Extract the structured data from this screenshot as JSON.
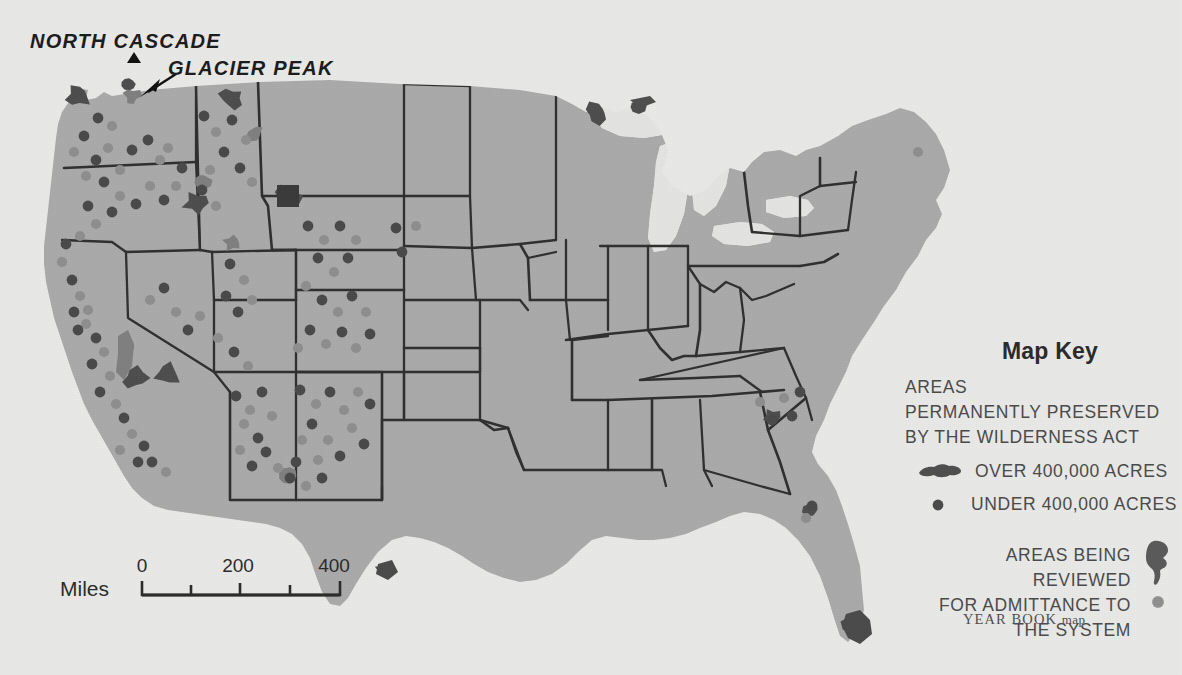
{
  "map": {
    "title_callouts": [
      {
        "id": "north-cascade",
        "text": "NORTH CASCADE"
      },
      {
        "id": "glacier-peak",
        "text": "GLACIER PEAK"
      }
    ],
    "colors": {
      "paper": "#e8e8e6",
      "land": "#a9a9a9",
      "water": "#e3e3e1",
      "wilderness_large": "#4e4e4e",
      "wilderness_small_dot": "#4a4a4a",
      "review_area": "#7f7f7f",
      "review_dot": "#8e8e8e",
      "border": "#2f2f2f",
      "text": "#3a3a3a"
    }
  },
  "scale": {
    "unit_label": "Miles",
    "tick_labels": [
      "0",
      "200",
      "400"
    ]
  },
  "key": {
    "title": "Map Key",
    "heading_lines": [
      "AREAS",
      "PERMANENTLY PRESERVED",
      "BY THE WILDERNESS ACT"
    ],
    "entries": [
      {
        "symbol": "wilderness-blob",
        "label": "OVER 400,000 ACRES"
      },
      {
        "symbol": "wilderness-dot",
        "label": "UNDER 400,000 ACRES"
      }
    ],
    "review_lines": [
      "AREAS BEING REVIEWED",
      "FOR ADMITTANCE TO",
      "THE SYSTEM"
    ]
  },
  "credit": {
    "bold_part": "YEAR BOOK",
    "light_part": "map"
  },
  "chart_data": {
    "type": "map",
    "title": "Areas Permanently Preserved by the Wilderness Act",
    "projection": "conterminous United States",
    "symbol_classes": [
      {
        "name": "over-400000-acres",
        "geometry": "filled-polygon",
        "tone": "dark"
      },
      {
        "name": "under-400000-acres",
        "geometry": "filled-circle",
        "tone": "dark"
      },
      {
        "name": "review-area-polygon",
        "geometry": "filled-polygon",
        "tone": "mid"
      },
      {
        "name": "review-area-dot",
        "geometry": "filled-circle",
        "tone": "mid"
      }
    ],
    "large_wilderness_areas": [
      {
        "name": "Olympic",
        "x": 78,
        "y": 96,
        "tone": "dark"
      },
      {
        "name": "North Cascade",
        "x": 128,
        "y": 84,
        "tone": "dark"
      },
      {
        "name": "Glacier Peak",
        "x": 132,
        "y": 96,
        "tone": "mid"
      },
      {
        "name": "Bob Marshall",
        "x": 232,
        "y": 98,
        "tone": "dark"
      },
      {
        "name": "Selway-Bitterroot",
        "x": 203,
        "y": 180,
        "tone": "mid"
      },
      {
        "name": "Idaho Primitive",
        "x": 196,
        "y": 203,
        "tone": "dark"
      },
      {
        "name": "Montana Divide",
        "x": 255,
        "y": 133,
        "tone": "mid"
      },
      {
        "name": "Yellowstone",
        "x": 288,
        "y": 196,
        "tone": "dark"
      },
      {
        "name": "High Uintas",
        "x": 232,
        "y": 243,
        "tone": "mid"
      },
      {
        "name": "Sierra/John Muir",
        "x": 126,
        "y": 352,
        "tone": "mid"
      },
      {
        "name": "Death Valley region",
        "x": 135,
        "y": 378,
        "tone": "dark"
      },
      {
        "name": "Mojave region",
        "x": 168,
        "y": 374,
        "tone": "dark"
      },
      {
        "name": "Gila",
        "x": 288,
        "y": 476,
        "tone": "mid"
      },
      {
        "name": "Big Bend",
        "x": 385,
        "y": 570,
        "tone": "dark"
      },
      {
        "name": "Boundary Waters",
        "x": 597,
        "y": 113,
        "tone": "dark"
      },
      {
        "name": "Isle Royale",
        "x": 637,
        "y": 105,
        "tone": "dark"
      },
      {
        "name": "Shining Rock",
        "x": 772,
        "y": 417,
        "tone": "dark"
      },
      {
        "name": "Okefenokee",
        "x": 812,
        "y": 509,
        "tone": "dark"
      },
      {
        "name": "Everglades",
        "x": 855,
        "y": 626,
        "tone": "dark"
      }
    ],
    "small_area_dot_count": 86,
    "review_dot_count": 30
  }
}
